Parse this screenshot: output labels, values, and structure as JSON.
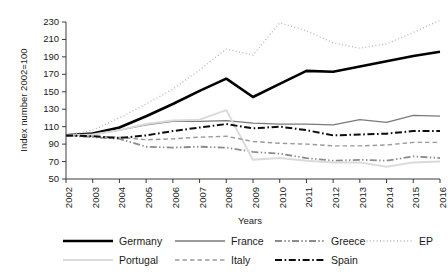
{
  "chart_data": {
    "type": "line",
    "title": "",
    "xlabel": "Years",
    "ylabel": "Index number 2002=100",
    "xlim": [
      2002,
      2016
    ],
    "ylim": [
      50,
      230
    ],
    "yticks": [
      50,
      70,
      90,
      110,
      130,
      150,
      170,
      190,
      210,
      230
    ],
    "grid": false,
    "legend_position": "bottom",
    "categories": [
      2002,
      2003,
      2004,
      2005,
      2006,
      2007,
      2008,
      2009,
      2010,
      2011,
      2012,
      2013,
      2014,
      2015,
      2016
    ],
    "x_tick_labels": [
      "2002",
      "2003",
      "2004",
      "2005",
      "2006",
      "2007",
      "2008",
      "2009",
      "2010",
      "2011",
      "2012",
      "2013",
      "2014",
      "2015",
      "2016"
    ],
    "y_tick_labels": [
      "50",
      "70",
      "90",
      "110",
      "130",
      "150",
      "170",
      "190",
      "210",
      "230"
    ],
    "series": [
      {
        "name": "Germany",
        "color": "#000000",
        "width": 2.6,
        "dash": "none",
        "values": [
          100,
          102,
          109,
          122,
          136,
          151,
          165,
          144,
          159,
          174,
          173,
          179,
          185,
          191,
          196
        ]
      },
      {
        "name": "France",
        "color": "#7a7a7a",
        "width": 1.3,
        "dash": "none",
        "values": [
          100,
          101,
          106,
          112,
          116,
          116,
          117,
          114,
          113,
          113,
          112,
          118,
          115,
          123,
          122
        ]
      },
      {
        "name": "Greece",
        "color": "#8c8c8c",
        "width": 1.8,
        "dash": "dashdotdot",
        "values": [
          100,
          98,
          96,
          87,
          86,
          87,
          86,
          81,
          79,
          74,
          71,
          72,
          71,
          76,
          74
        ]
      },
      {
        "name": "EP",
        "color": "#b4b4b4",
        "width": 1.3,
        "dash": "dotted",
        "values": [
          100,
          106,
          120,
          136,
          153,
          175,
          199,
          192,
          229,
          220,
          206,
          200,
          205,
          218,
          232
        ]
      },
      {
        "name": "Portugal",
        "color": "#dadada",
        "width": 1.9,
        "dash": "none",
        "values": [
          100,
          101,
          106,
          113,
          117,
          118,
          129,
          72,
          74,
          71,
          69,
          69,
          64,
          69,
          70
        ]
      },
      {
        "name": "Italy",
        "color": "#9a9a9a",
        "width": 1.4,
        "dash": "dashed",
        "values": [
          100,
          99,
          98,
          95,
          96,
          98,
          99,
          93,
          91,
          90,
          88,
          88,
          89,
          92,
          92
        ]
      },
      {
        "name": "Spain",
        "color": "#0d0d0d",
        "width": 2.0,
        "dash": "dashdot",
        "values": [
          100,
          99,
          97,
          100,
          105,
          109,
          113,
          108,
          110,
          106,
          100,
          101,
          102,
          105,
          105
        ]
      }
    ]
  },
  "legend": {
    "rows": [
      [
        {
          "name": "Germany",
          "label": "Germany"
        },
        {
          "name": "France",
          "label": "France"
        },
        {
          "name": "Greece",
          "label": "Greece"
        },
        {
          "name": "EP",
          "label": "EP"
        }
      ],
      [
        {
          "name": "Portugal",
          "label": "Portugal"
        },
        {
          "name": "Italy",
          "label": "Italy"
        },
        {
          "name": "Spain",
          "label": "Spain"
        }
      ]
    ]
  }
}
